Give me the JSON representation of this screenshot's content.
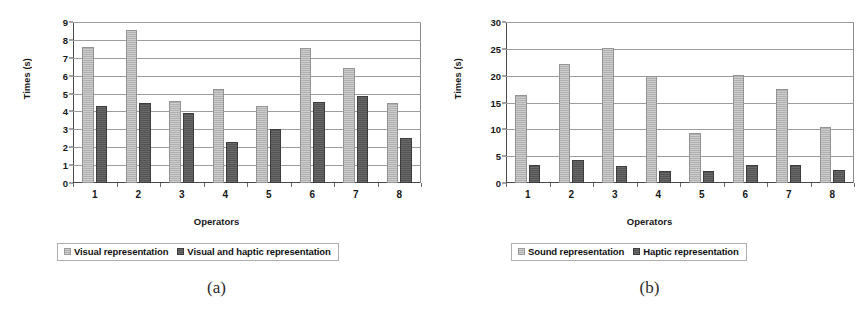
{
  "figure": {
    "panels": [
      {
        "caption": "(a)",
        "ylabel": "Times (s)",
        "xlabel": "Operators",
        "legend": [
          {
            "label": "Visual representation",
            "swatch": "light-gray-swatch-icon",
            "color": "#b7b7b7"
          },
          {
            "label": "Visual and haptic representation",
            "swatch": "dark-gray-swatch-icon",
            "color": "#585858"
          }
        ]
      },
      {
        "caption": "(b)",
        "ylabel": "Times (s)",
        "xlabel": "Operators",
        "legend": [
          {
            "label": "Sound representation",
            "swatch": "light-gray-swatch-icon",
            "color": "#b7b7b7"
          },
          {
            "label": "Haptic representation",
            "swatch": "dark-gray-swatch-icon",
            "color": "#585858"
          }
        ]
      }
    ]
  },
  "chart_data": [
    {
      "type": "bar",
      "title": "(a)",
      "xlabel": "Operators",
      "ylabel": "Times (s)",
      "categories": [
        "1",
        "2",
        "3",
        "4",
        "5",
        "6",
        "7",
        "8"
      ],
      "ylim": [
        0,
        9
      ],
      "yticks": [
        0,
        1,
        2,
        3,
        4,
        5,
        6,
        7,
        8,
        9
      ],
      "ytick_labels": [
        "0",
        "1",
        "2",
        "3",
        "4",
        "5",
        "6",
        "7",
        "8",
        "9"
      ],
      "grid": true,
      "legend_position": "below",
      "series": [
        {
          "name": "Visual representation",
          "color": "#b7b7b7",
          "values": [
            7.6,
            8.55,
            4.6,
            5.25,
            4.3,
            7.55,
            6.45,
            4.5
          ]
        },
        {
          "name": "Visual and haptic representation",
          "color": "#585858",
          "values": [
            4.3,
            4.5,
            3.9,
            2.3,
            3.0,
            4.55,
            4.85,
            2.5
          ]
        }
      ]
    },
    {
      "type": "bar",
      "title": "(b)",
      "xlabel": "Operators",
      "ylabel": "Times (s)",
      "categories": [
        "1",
        "2",
        "3",
        "4",
        "5",
        "6",
        "7",
        "8"
      ],
      "ylim": [
        0,
        30
      ],
      "yticks": [
        0,
        5,
        10,
        15,
        20,
        25,
        30
      ],
      "ytick_labels": [
        "0",
        "5",
        "10",
        "15",
        "20",
        "25",
        "30"
      ],
      "grid": true,
      "legend_position": "below",
      "series": [
        {
          "name": "Sound representation",
          "color": "#b7b7b7",
          "values": [
            16.4,
            22.1,
            25.1,
            20.0,
            9.4,
            20.1,
            17.5,
            10.5
          ]
        },
        {
          "name": "Haptic representation",
          "color": "#585858",
          "values": [
            3.4,
            4.2,
            3.2,
            2.3,
            2.3,
            3.4,
            3.4,
            2.4
          ]
        }
      ]
    }
  ]
}
